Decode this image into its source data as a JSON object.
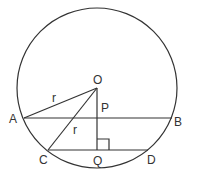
{
  "diagram": {
    "labels": {
      "O": "O",
      "P": "P",
      "A": "A",
      "B": "B",
      "C": "C",
      "Q": "Q",
      "D": "D",
      "r1": "r",
      "r2": "r"
    },
    "stroke_color": "#333333"
  }
}
